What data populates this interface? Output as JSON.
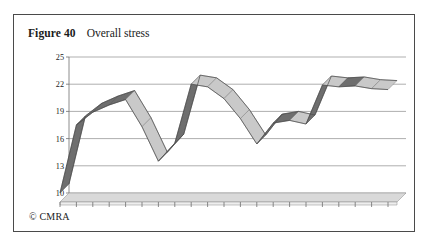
{
  "figure": {
    "label": "Figure 40",
    "title": "Overall stress",
    "credit": "© CMRA"
  },
  "chart_data": {
    "type": "line",
    "title": "Overall stress",
    "xlabel": "",
    "ylabel": "",
    "ylim": [
      10,
      25
    ],
    "yticks": [
      25,
      22,
      19,
      16,
      13,
      10
    ],
    "grid": true,
    "legend": "none",
    "style": "3d-ribbon",
    "categories": [
      "06/97",
      "09/97",
      "12/97",
      "03/98",
      "06/98",
      "09/98",
      "12/98",
      "03/99",
      "06/99",
      "09/99",
      "12/99",
      "03/00",
      "06/00",
      "09/00",
      "12/00",
      "03/01",
      "06/01",
      "09/01",
      "12/01",
      "03/02",
      "06/02"
    ],
    "values": [
      11.0,
      18.5,
      19.9,
      20.7,
      21.3,
      18.3,
      14.5,
      16.5,
      23.0,
      22.7,
      21.4,
      19.2,
      16.4,
      18.7,
      19.0,
      18.6,
      22.9,
      22.7,
      22.8,
      22.5,
      22.4
    ],
    "colors": {
      "ribbon_top": "#bdbdbd",
      "ribbon_rising": "#6e6e6e",
      "ribbon_falling": "#c9c9c9",
      "gridline": "#8d8d8d",
      "floor": "#d9d9d9"
    }
  }
}
